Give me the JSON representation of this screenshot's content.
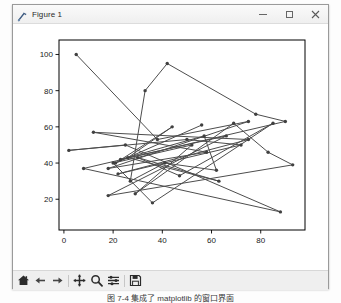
{
  "window": {
    "title": "Figure 1",
    "icon": "matplotlib-figure-icon",
    "controls": {
      "minimize_label": "–",
      "maximize_label": "□",
      "close_label": "×"
    }
  },
  "toolbar": {
    "items": [
      {
        "name": "home-icon",
        "tooltip": "Home"
      },
      {
        "name": "back-arrow-icon",
        "tooltip": "Back"
      },
      {
        "name": "forward-arrow-icon",
        "tooltip": "Forward"
      },
      {
        "name": "pan-move-icon",
        "tooltip": "Pan"
      },
      {
        "name": "zoom-magnifier-icon",
        "tooltip": "Zoom to rectangle"
      },
      {
        "name": "subplot-config-icon",
        "tooltip": "Configure subplots"
      },
      {
        "name": "save-disk-icon",
        "tooltip": "Save the figure"
      }
    ]
  },
  "caption": "图 7-4   集成了 matplotlib 的窗口界面",
  "colors": {
    "line": "#4d4d4d",
    "marker": "#404040",
    "axes_edge": "#000000",
    "tick_label": "#1a1a1a",
    "figure_face": "#ffffff",
    "window_chrome": "#f0f0f0",
    "titlebar": "#fafafa"
  },
  "chart_data": {
    "type": "line",
    "title": "",
    "xlabel": "",
    "ylabel": "",
    "xlim": [
      -2,
      98
    ],
    "ylim": [
      3,
      108
    ],
    "xticks": [
      0,
      20,
      40,
      60,
      80
    ],
    "yticks": [
      20,
      40,
      60,
      80,
      100
    ],
    "grid": false,
    "legend": null,
    "marker": "dot",
    "linewidth": 1,
    "series": [
      {
        "name": "random-walk",
        "points": [
          [
            5,
            100
          ],
          [
            38,
            53
          ],
          [
            75,
            63
          ],
          [
            18,
            37
          ],
          [
            58,
            46
          ],
          [
            12,
            57
          ],
          [
            75,
            53
          ],
          [
            22,
            34
          ],
          [
            72,
            50
          ],
          [
            50,
            53
          ],
          [
            2,
            47
          ],
          [
            25,
            50
          ],
          [
            88,
            13
          ],
          [
            8,
            37
          ],
          [
            90,
            63
          ],
          [
            78,
            67
          ],
          [
            42,
            95
          ],
          [
            33,
            80
          ],
          [
            27,
            30
          ],
          [
            41,
            40
          ],
          [
            62,
            36
          ],
          [
            57,
            55
          ],
          [
            23,
            42
          ],
          [
            66,
            55
          ],
          [
            18,
            22
          ],
          [
            93,
            39
          ],
          [
            83,
            46
          ],
          [
            69,
            62
          ],
          [
            29,
            23
          ],
          [
            52,
            50
          ],
          [
            20,
            40
          ],
          [
            36,
            18
          ],
          [
            85,
            62
          ],
          [
            47,
            33
          ],
          [
            30,
            43
          ],
          [
            63,
            30
          ],
          [
            26,
            43
          ],
          [
            44,
            60
          ],
          [
            21,
            40
          ],
          [
            56,
            61
          ]
        ]
      }
    ]
  }
}
